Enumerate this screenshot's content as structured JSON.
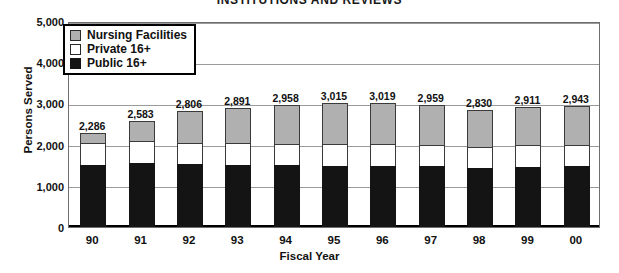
{
  "chart_data": {
    "type": "bar",
    "subtype": "stacked-column",
    "title": "INSTITUTIONS AND REVIEWS",
    "xlabel": "Fiscal Year",
    "ylabel": "Persons Served",
    "categories": [
      "90",
      "91",
      "92",
      "93",
      "94",
      "95",
      "96",
      "97",
      "98",
      "99",
      "00"
    ],
    "series": [
      {
        "name": "Public 16+",
        "color": "#141414",
        "values": [
          1510,
          1545,
          1520,
          1510,
          1500,
          1490,
          1480,
          1475,
          1430,
          1455,
          1470
        ]
      },
      {
        "name": "Private 16+",
        "color": "#ffffff",
        "values": [
          530,
          540,
          530,
          530,
          525,
          530,
          530,
          525,
          510,
          525,
          530
        ]
      },
      {
        "name": "Nursing Facilities",
        "color": "#b0b0b0",
        "values": [
          246,
          498,
          756,
          851,
          933,
          995,
          1009,
          959,
          890,
          931,
          943
        ]
      }
    ],
    "totals": [
      2286,
      2583,
      2806,
      2891,
      2958,
      3015,
      3019,
      2959,
      2830,
      2911,
      2943
    ],
    "total_labels": [
      "2,286",
      "2,583",
      "2,806",
      "2,891",
      "2,958",
      "3,015",
      "3,019",
      "2,959",
      "2,830",
      "2,911",
      "2,943"
    ],
    "ylim": [
      0,
      5000
    ],
    "yticks": [
      0,
      1000,
      2000,
      3000,
      4000,
      5000
    ],
    "ytick_labels": [
      "0",
      "1,000",
      "2,000",
      "3,000",
      "4,000",
      "5,000"
    ],
    "grid": true,
    "legend_position": "top-left"
  },
  "legend": {
    "items": [
      {
        "label": "Nursing Facilities",
        "swatch": "nursing-facilities-swatch"
      },
      {
        "label": "Private 16+",
        "swatch": "private-16-plus-swatch"
      },
      {
        "label": "Public 16+",
        "swatch": "public-16-plus-swatch"
      }
    ]
  }
}
